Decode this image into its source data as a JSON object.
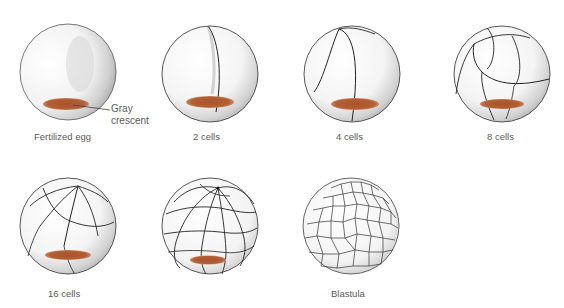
{
  "colors": {
    "background": "#ffffff",
    "outline": "#2a2a2a",
    "stipple": "#9a9a9a",
    "gray_crescent": "#a8532a",
    "label_text": "#5a5a5a"
  },
  "stages": [
    {
      "id": "fertilized-egg",
      "label": "Fertilized egg",
      "cells": 1
    },
    {
      "id": "2-cells",
      "label": "2 cells",
      "cells": 2
    },
    {
      "id": "4-cells",
      "label": "4 cells",
      "cells": 4
    },
    {
      "id": "8-cells",
      "label": "8 cells",
      "cells": 8
    },
    {
      "id": "16-cells",
      "label": "16 cells",
      "cells": 16
    },
    {
      "id": "32-cells",
      "label": "",
      "cells": 32
    },
    {
      "id": "blastula",
      "label": "Blastula",
      "cells": null
    }
  ],
  "annotation": {
    "line1": "Gray",
    "line2": "crescent"
  }
}
